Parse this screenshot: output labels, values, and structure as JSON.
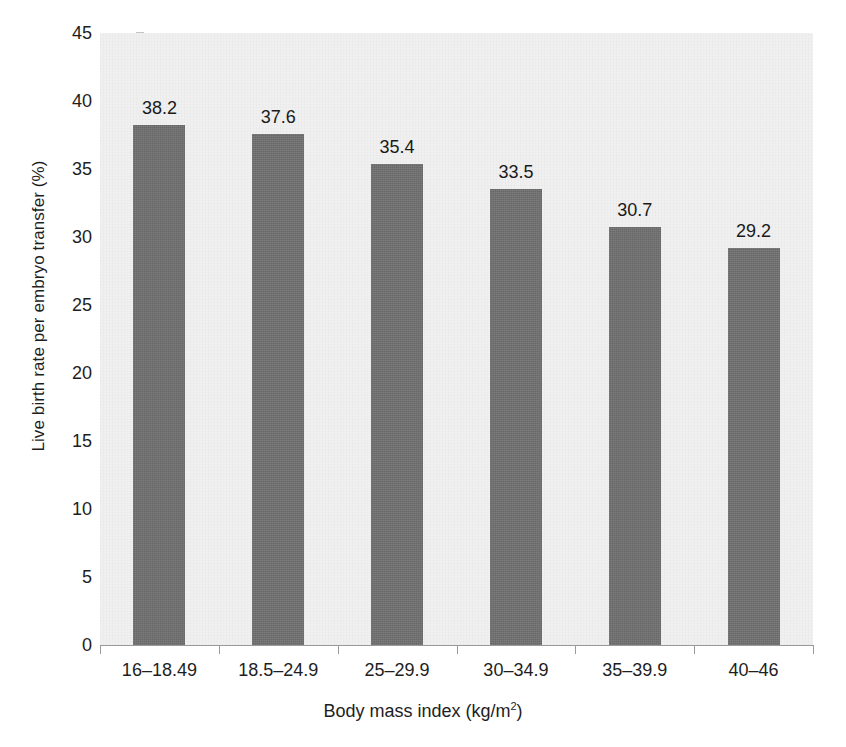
{
  "chart_data": {
    "type": "bar",
    "title": "",
    "xlabel": "Body mass index (kg/m2)",
    "ylabel": "Live birth rate per embryo transfer (%)",
    "categories": [
      "16–18.49",
      "18.5–24.9",
      "25–29.9",
      "30–34.9",
      "35–39.9",
      "40–46"
    ],
    "values": [
      38.2,
      37.6,
      35.4,
      33.5,
      30.7,
      29.2
    ],
    "value_labels": [
      "38.2",
      "37.6",
      "35.4",
      "33.5",
      "30.7",
      "29.2"
    ],
    "ylim": [
      0,
      45
    ],
    "ytick_values": [
      0,
      5,
      10,
      15,
      20,
      25,
      30,
      35,
      40,
      45
    ],
    "ytick_labels": [
      "0",
      "5",
      "10",
      "15",
      "20",
      "25",
      "30",
      "35",
      "40",
      "45"
    ],
    "grid": false,
    "legend": null,
    "colors": {
      "bar": "#6e6e6e",
      "plot_background": "#f0f0f0",
      "figure_background": "#ffffff",
      "axis": "#9a9a9a",
      "text": "#1e1e1e"
    }
  },
  "axis_title_x_prefix": "Body mass index (kg/m",
  "axis_title_x_superscript": "2",
  "axis_title_x_suffix": ")"
}
